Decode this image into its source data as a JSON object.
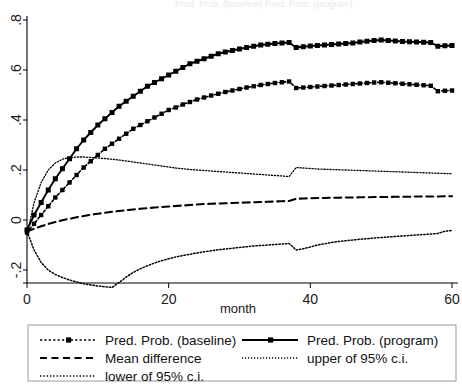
{
  "figure": {
    "faint_top_title": "Pred. Prob. (baseline)   Pred. Prob. (program)"
  },
  "chart_data": {
    "type": "line",
    "title": "",
    "xlabel": "month",
    "ylabel": "",
    "xlim": [
      0,
      60
    ],
    "ylim": [
      -0.3,
      0.8
    ],
    "grid": false,
    "legend_position": "bottom",
    "xticks": [
      0,
      20,
      40,
      60
    ],
    "xtick_labels": [
      "0",
      "20",
      "40",
      "60"
    ],
    "yticks": [
      -0.2,
      0,
      0.2,
      0.4,
      0.6,
      0.8
    ],
    "ytick_labels": [
      "-.2",
      "0",
      ".2",
      ".4",
      ".6",
      ".8"
    ],
    "x": [
      0,
      1,
      2,
      3,
      4,
      5,
      6,
      7,
      8,
      9,
      10,
      11,
      12,
      13,
      14,
      15,
      16,
      17,
      18,
      19,
      20,
      21,
      22,
      23,
      24,
      25,
      26,
      27,
      28,
      29,
      30,
      31,
      32,
      33,
      34,
      35,
      36,
      37,
      38,
      39,
      40,
      41,
      42,
      43,
      44,
      45,
      46,
      47,
      48,
      49,
      50,
      51,
      52,
      53,
      54,
      55,
      56,
      57,
      58,
      59,
      60
    ],
    "series": [
      {
        "name": "Pred. Prob. (program)",
        "style": "solid-marker",
        "marker": "square",
        "values": [
          -0.04,
          0.02,
          0.07,
          0.12,
          0.165,
          0.205,
          0.245,
          0.285,
          0.32,
          0.35,
          0.38,
          0.405,
          0.43,
          0.455,
          0.475,
          0.495,
          0.515,
          0.535,
          0.55,
          0.565,
          0.58,
          0.595,
          0.61,
          0.625,
          0.635,
          0.645,
          0.655,
          0.665,
          0.672,
          0.678,
          0.684,
          0.69,
          0.695,
          0.7,
          0.703,
          0.706,
          0.708,
          0.71,
          0.69,
          0.693,
          0.696,
          0.698,
          0.7,
          0.702,
          0.704,
          0.706,
          0.708,
          0.712,
          0.715,
          0.718,
          0.72,
          0.718,
          0.716,
          0.714,
          0.713,
          0.712,
          0.711,
          0.71,
          0.695,
          0.697,
          0.698
        ]
      },
      {
        "name": "Pred. Prob. (baseline)",
        "style": "dotted-marker",
        "marker": "square",
        "values": [
          -0.05,
          -0.015,
          0.02,
          0.055,
          0.09,
          0.12,
          0.15,
          0.18,
          0.21,
          0.235,
          0.26,
          0.285,
          0.305,
          0.325,
          0.345,
          0.365,
          0.38,
          0.395,
          0.41,
          0.425,
          0.44,
          0.45,
          0.462,
          0.472,
          0.482,
          0.49,
          0.498,
          0.505,
          0.512,
          0.518,
          0.524,
          0.53,
          0.535,
          0.54,
          0.544,
          0.548,
          0.551,
          0.554,
          0.528,
          0.53,
          0.532,
          0.534,
          0.536,
          0.538,
          0.54,
          0.542,
          0.544,
          0.546,
          0.548,
          0.55,
          0.551,
          0.549,
          0.547,
          0.545,
          0.543,
          0.541,
          0.539,
          0.537,
          0.515,
          0.517,
          0.518
        ]
      },
      {
        "name": "upper of 95% c.i.",
        "style": "fine-dotted",
        "marker": "none",
        "values": [
          -0.06,
          0.07,
          0.15,
          0.2,
          0.228,
          0.243,
          0.25,
          0.252,
          0.252,
          0.25,
          0.248,
          0.246,
          0.243,
          0.24,
          0.236,
          0.232,
          0.228,
          0.224,
          0.22,
          0.216,
          0.212,
          0.208,
          0.205,
          0.202,
          0.2,
          0.198,
          0.196,
          0.194,
          0.192,
          0.19,
          0.188,
          0.186,
          0.184,
          0.182,
          0.18,
          0.178,
          0.176,
          0.174,
          0.21,
          0.208,
          0.206,
          0.204,
          0.203,
          0.202,
          0.201,
          0.2,
          0.199,
          0.198,
          0.197,
          0.196,
          0.195,
          0.194,
          0.193,
          0.192,
          0.191,
          0.19,
          0.189,
          0.188,
          0.187,
          0.186,
          0.185
        ]
      },
      {
        "name": "Mean difference",
        "style": "dashed",
        "marker": "none",
        "values": [
          -0.045,
          -0.035,
          -0.025,
          -0.016,
          -0.008,
          -0.001,
          0.005,
          0.011,
          0.016,
          0.021,
          0.025,
          0.029,
          0.033,
          0.036,
          0.039,
          0.042,
          0.045,
          0.047,
          0.05,
          0.052,
          0.054,
          0.056,
          0.058,
          0.06,
          0.062,
          0.064,
          0.065,
          0.066,
          0.067,
          0.068,
          0.069,
          0.07,
          0.071,
          0.072,
          0.073,
          0.074,
          0.075,
          0.076,
          0.085,
          0.086,
          0.087,
          0.088,
          0.088,
          0.089,
          0.089,
          0.09,
          0.09,
          0.091,
          0.091,
          0.092,
          0.092,
          0.092,
          0.093,
          0.093,
          0.093,
          0.094,
          0.094,
          0.094,
          0.094,
          0.095,
          0.095
        ]
      },
      {
        "name": "lower of 95% c.i.",
        "style": "dash-dot",
        "marker": "none",
        "values": [
          -0.045,
          -0.12,
          -0.17,
          -0.2,
          -0.218,
          -0.23,
          -0.24,
          -0.248,
          -0.255,
          -0.26,
          -0.264,
          -0.267,
          -0.27,
          -0.25,
          -0.228,
          -0.21,
          -0.195,
          -0.183,
          -0.172,
          -0.163,
          -0.155,
          -0.148,
          -0.142,
          -0.137,
          -0.132,
          -0.127,
          -0.123,
          -0.119,
          -0.116,
          -0.113,
          -0.11,
          -0.107,
          -0.104,
          -0.102,
          -0.1,
          -0.098,
          -0.096,
          -0.094,
          -0.12,
          -0.115,
          -0.108,
          -0.1,
          -0.095,
          -0.09,
          -0.086,
          -0.083,
          -0.08,
          -0.077,
          -0.075,
          -0.072,
          -0.07,
          -0.068,
          -0.066,
          -0.064,
          -0.062,
          -0.06,
          -0.058,
          -0.056,
          -0.054,
          -0.045,
          -0.042
        ]
      }
    ]
  },
  "legend": {
    "entries": [
      {
        "label": "Pred. Prob. (baseline)",
        "style": "dotted-marker"
      },
      {
        "label": "Pred. Prob. (program)",
        "style": "solid-marker"
      },
      {
        "label": "Mean difference",
        "style": "dashed"
      },
      {
        "label": "upper of 95% c.i.",
        "style": "fine-dotted"
      },
      {
        "label": "lower of 95% c.i.",
        "style": "dash-dot"
      }
    ]
  },
  "colors": {
    "line": "#000000",
    "axis": "#000000",
    "legend_border": "#999999",
    "background": "#ffffff"
  }
}
